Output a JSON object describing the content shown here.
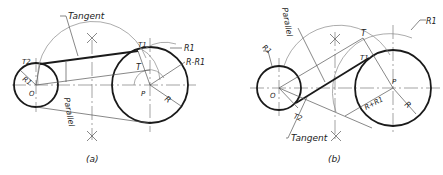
{
  "figure_a": {
    "caption": "(a)",
    "labels": {
      "tangent": "Tangent",
      "parallel": "Parallel",
      "t2": "T2",
      "t1": "T1",
      "t": "T",
      "r1": "R1",
      "r1_inner": "R1",
      "r_minus_r1": "R-R1",
      "r": "R",
      "o": "O",
      "p": "P"
    }
  },
  "figure_b": {
    "caption": "(b)",
    "labels": {
      "tangent": "Tangent",
      "parallel": "Parallel",
      "t2": "T2",
      "t1": "T1",
      "t": "T",
      "r1": "R1",
      "r1_outer": "R1",
      "r_plus_r1": "R+R1",
      "r": "R",
      "o": "O",
      "p": "P"
    }
  },
  "colors": {
    "line": "#1a1a1a",
    "construction": "#888888",
    "background": "#ffffff"
  }
}
